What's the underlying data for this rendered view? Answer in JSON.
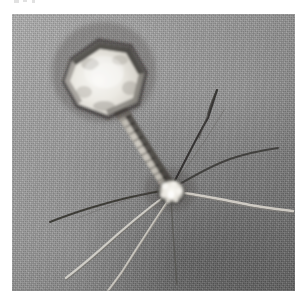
{
  "page": {
    "background_color": "#ffffff",
    "width": 305,
    "height": 304
  },
  "micrograph": {
    "title": "bacteriophage-electron-micrograph",
    "modality": "transmission electron micrograph",
    "color_mode": "grayscale",
    "frame": {
      "left": 12,
      "top": 14,
      "width": 283,
      "height": 277
    },
    "background": {
      "base_color": "#8d8d8d",
      "highlight_color": "#b4b4b4",
      "shadow_color": "#6f6f6f",
      "illumination": "diagonal, light at upper-left, dark toward lower-right",
      "texture": "fine film grain"
    },
    "specimen": {
      "name": "bacteriophage",
      "morphology": "tailed phage (Myoviridae-like) with icosahedral head, contractile tail and long tail fibers",
      "parts": [
        {
          "name": "capsid-head",
          "label": "head",
          "shape": "hexagonal projection of icosahedron",
          "center": [
            104,
            70
          ],
          "radius": 47,
          "fill_color": "#ecebe6",
          "edge_color": "#3d3a37",
          "note": "bright electron-lucent head with dark stain outline, darkest along upper edge"
        },
        {
          "name": "neck-collar",
          "label": "neck",
          "from": [
            116,
            111
          ],
          "to": [
            129,
            131
          ],
          "fill_color": "#7a7570"
        },
        {
          "name": "tail-sheath",
          "label": "tail",
          "from": [
            125,
            122
          ],
          "to": [
            170,
            188
          ],
          "width": 13,
          "fill_color": "#b9b5ae",
          "edge_color": "#33302d",
          "striations": 14,
          "note": "banded contractile sheath with dark transverse striations"
        },
        {
          "name": "baseplate",
          "label": "baseplate",
          "center": [
            170,
            190
          ],
          "radius": 13,
          "fill_color": "#f1efe9",
          "note": "bright irregular knob where tail fibers converge"
        }
      ],
      "tail_fibers": [
        {
          "name": "fiber-upper-right",
          "points": [
            [
              172,
              186
            ],
            [
              196,
              142
            ],
            [
              214,
              104
            ],
            [
              219,
              88
            ],
            [
              213,
              84
            ],
            [
              209,
              90
            ],
            [
              206,
              100
            ]
          ],
          "color": "#2f2d2b"
        },
        {
          "name": "fiber-right-upper",
          "points": [
            [
              173,
              188
            ],
            [
              204,
              172
            ],
            [
              232,
              160
            ],
            [
              258,
              154
            ],
            [
              276,
              150
            ]
          ],
          "color": "#3a3836"
        },
        {
          "name": "fiber-right-lower",
          "points": [
            [
              175,
              191
            ],
            [
              205,
              194
            ],
            [
              232,
              199
            ],
            [
              256,
              204
            ],
            [
              278,
              206
            ]
          ],
          "color": "#d8d5cf"
        },
        {
          "name": "fiber-left-flat",
          "points": [
            [
              166,
              189
            ],
            [
              132,
              194
            ],
            [
              102,
              200
            ],
            [
              72,
              210
            ],
            [
              52,
              219
            ]
          ],
          "color": "#35332f"
        },
        {
          "name": "fiber-lower-left-a",
          "points": [
            [
              168,
              192
            ],
            [
              140,
              210
            ],
            [
              112,
              232
            ],
            [
              88,
              252
            ],
            [
              70,
              266
            ]
          ],
          "color": "#e2dfd8"
        },
        {
          "name": "fiber-lower-left-b",
          "points": [
            [
              170,
              194
            ],
            [
              150,
              220
            ],
            [
              128,
              248
            ],
            [
              110,
              272
            ],
            [
              99,
              288
            ]
          ],
          "color": "#ddd9d2"
        },
        {
          "name": "fiber-down",
          "points": [
            [
              171,
              196
            ],
            [
              172,
              214
            ],
            [
              174,
              236
            ],
            [
              176,
              258
            ],
            [
              177,
              276
            ]
          ],
          "color": "#53504c"
        }
      ]
    }
  }
}
